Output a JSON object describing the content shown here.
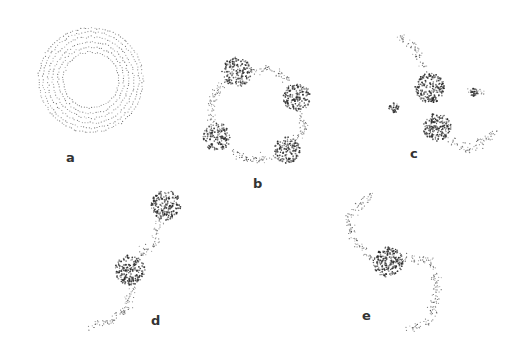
{
  "figure": {
    "background": "#ffffff",
    "dot_color": "#2a2a2a",
    "panels": [
      {
        "id": "a",
        "label": "a",
        "label_pos": [
          70,
          158
        ],
        "description": "concentric dotted rings (initial uniform ring)",
        "rings": {
          "center": [
            91,
            80
          ],
          "radii": [
            28,
            33,
            38,
            43,
            48,
            52
          ],
          "points_per_ring": 70
        }
      },
      {
        "id": "b",
        "label": "b",
        "label_pos": [
          256,
          183
        ],
        "description": "ring fragmented into four clumps connected by filaments",
        "clumps": [
          {
            "center": [
              237,
              72
            ],
            "r": 15,
            "n": 170
          },
          {
            "center": [
              297,
              97
            ],
            "r": 14,
            "n": 160
          },
          {
            "center": [
              217,
              137
            ],
            "r": 14,
            "n": 150
          },
          {
            "center": [
              287,
              150
            ],
            "r": 13,
            "n": 150
          }
        ],
        "filaments": [
          [
            [
              251,
              70
            ],
            [
              272,
              68
            ],
            [
              288,
              80
            ]
          ],
          [
            [
              300,
              112
            ],
            [
              305,
              128
            ],
            [
              296,
              140
            ]
          ],
          [
            [
              275,
              157
            ],
            [
              250,
              160
            ],
            [
              230,
              152
            ]
          ],
          [
            [
              212,
              124
            ],
            [
              212,
              100
            ],
            [
              224,
              80
            ]
          ]
        ]
      },
      {
        "id": "c",
        "label": "c",
        "label_pos": [
          410,
          151
        ],
        "description": "two merging clumps with tidal arc and two small knots",
        "clumps": [
          {
            "center": [
              430,
              88
            ],
            "r": 15,
            "n": 200
          },
          {
            "center": [
              437,
              127
            ],
            "r": 14,
            "n": 180
          },
          {
            "center": [
              394,
              108
            ],
            "r": 5,
            "n": 35
          },
          {
            "center": [
              474,
              92
            ],
            "r": 4,
            "n": 25
          }
        ],
        "filaments": [
          [
            [
              398,
              36
            ],
            [
              415,
              48
            ],
            [
              425,
              70
            ]
          ],
          [
            [
              447,
              138
            ],
            [
              470,
              150
            ],
            [
              497,
              130
            ]
          ],
          [
            [
              470,
              92
            ],
            [
              485,
              93
            ]
          ]
        ]
      },
      {
        "id": "d",
        "label": "d",
        "label_pos": [
          153,
          320
        ],
        "description": "two clumps connected by a bridge with a tail",
        "clumps": [
          {
            "center": [
              166,
              205
            ],
            "r": 15,
            "n": 200
          },
          {
            "center": [
              130,
              270
            ],
            "r": 15,
            "n": 200
          }
        ],
        "filaments": [
          [
            [
              160,
              220
            ],
            [
              155,
              245
            ],
            [
              140,
              255
            ]
          ],
          [
            [
              133,
              285
            ],
            [
              125,
              310
            ],
            [
              110,
              322
            ],
            [
              92,
              325
            ]
          ]
        ]
      },
      {
        "id": "e",
        "label": "e",
        "label_pos": [
          364,
          314
        ],
        "description": "single central clump with two spiral arms",
        "clumps": [
          {
            "center": [
              388,
              262
            ],
            "r": 15,
            "n": 220
          }
        ],
        "filaments": [
          [
            [
              373,
              260
            ],
            [
              352,
              240
            ],
            [
              348,
              215
            ],
            [
              372,
              195
            ]
          ],
          [
            [
              402,
              258
            ],
            [
              430,
              260
            ],
            [
              438,
              290
            ],
            [
              430,
              320
            ],
            [
              410,
              328
            ]
          ]
        ]
      }
    ]
  }
}
